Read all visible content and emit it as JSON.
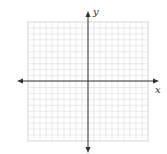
{
  "chart_data": {
    "type": "scatter",
    "title": "",
    "xlabel": "x",
    "ylabel": "y",
    "grid": true,
    "grid_cells": {
      "x": 20,
      "y": 20
    },
    "xlim": [
      -10,
      10
    ],
    "ylim": [
      -10,
      10
    ],
    "series": [],
    "axis_arrows": true
  },
  "labels": {
    "x_axis": "x",
    "y_axis": "y"
  },
  "colors": {
    "grid": "#d8d8d8",
    "axis": "#333333",
    "background": "#ffffff"
  }
}
